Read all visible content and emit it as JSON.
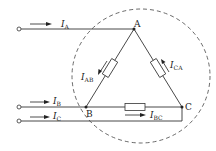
{
  "diagram": {
    "type": "delta-connected three-phase load",
    "nodes": {
      "A": "A",
      "B": "B",
      "C": "C"
    },
    "line_currents": [
      {
        "symbol": "I",
        "sub": "A"
      },
      {
        "symbol": "I",
        "sub": "B"
      },
      {
        "symbol": "I",
        "sub": "C"
      }
    ],
    "phase_currents": [
      {
        "symbol": "I",
        "sub": "AB"
      },
      {
        "symbol": "I",
        "sub": "BC"
      },
      {
        "symbol": "I",
        "sub": "CA"
      }
    ],
    "colors": {
      "line": "#333333",
      "resistor_fill": "#ffffff",
      "background": "#ffffff"
    }
  }
}
